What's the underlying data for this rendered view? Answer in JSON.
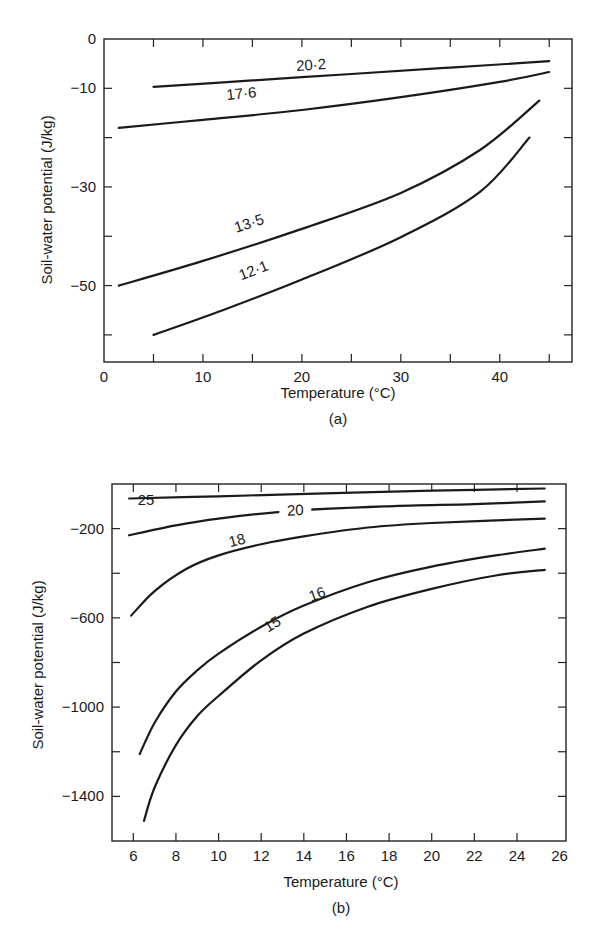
{
  "chart_data": [
    {
      "id": "a",
      "type": "line",
      "panel_label": "(a)",
      "title": "",
      "xlabel": "Temperature (°C)",
      "ylabel": "Soil-water potential (J/kg)",
      "xlim": [
        0,
        47.3
      ],
      "ylim": [
        -65.5,
        0
      ],
      "x_ticks": [
        5,
        10,
        15,
        20,
        25,
        30,
        35,
        40,
        45
      ],
      "x_tick_labels": [
        {
          "v": 0,
          "t": "0"
        },
        {
          "v": 10,
          "t": "10"
        },
        {
          "v": 20,
          "t": "20"
        },
        {
          "v": 30,
          "t": "30"
        },
        {
          "v": 40,
          "t": "40"
        }
      ],
      "y_ticks": [
        -10,
        -20,
        -30,
        -40,
        -50,
        -60
      ],
      "y_tick_labels": [
        {
          "v": 0,
          "t": "0"
        },
        {
          "v": -10,
          "t": "-10"
        },
        {
          "v": -30,
          "t": "-30"
        },
        {
          "v": -50,
          "t": "-50"
        }
      ],
      "grid": false,
      "legend": "inline curve labels (water content, %)",
      "series": [
        {
          "name": "20·2",
          "x": [
            5,
            15,
            25,
            35,
            45
          ],
          "y": [
            -9.7,
            -8.4,
            -7.1,
            -5.8,
            -4.5
          ],
          "label_at": [
            21,
            -7.5
          ]
        },
        {
          "name": "17·6",
          "x": [
            1.5,
            10,
            20,
            30,
            40,
            45
          ],
          "y": [
            -18,
            -16.4,
            -14.4,
            -11.8,
            -8.7,
            -6.7
          ],
          "label_at": [
            14,
            -13.3
          ]
        },
        {
          "name": "13·5",
          "x": [
            1.5,
            10,
            20,
            30,
            38,
            44
          ],
          "y": [
            -50,
            -45,
            -38.5,
            -31.2,
            -22.5,
            -12.5
          ],
          "label_at": [
            15,
            -39.5
          ]
        },
        {
          "name": "12·1",
          "x": [
            5,
            12,
            20,
            30,
            38,
            43
          ],
          "y": [
            -60,
            -55,
            -48.8,
            -40.2,
            -31,
            -20
          ],
          "label_at": [
            15.5,
            -49
          ]
        }
      ]
    },
    {
      "id": "b",
      "type": "line",
      "panel_label": "(b)",
      "title": "",
      "xlabel": "Temperature (°C)",
      "ylabel": "Soil-water potential (J/kg)",
      "xlim": [
        5,
        26.3
      ],
      "ylim": [
        -1600,
        0
      ],
      "x_ticks": [
        6,
        8,
        10,
        12,
        14,
        16,
        18,
        20,
        22,
        24
      ],
      "x_tick_labels": [
        {
          "v": 6,
          "t": "6"
        },
        {
          "v": 8,
          "t": "8"
        },
        {
          "v": 10,
          "t": "10"
        },
        {
          "v": 12,
          "t": "12"
        },
        {
          "v": 14,
          "t": "14"
        },
        {
          "v": 16,
          "t": "16"
        },
        {
          "v": 18,
          "t": "18"
        },
        {
          "v": 20,
          "t": "20"
        },
        {
          "v": 22,
          "t": "22"
        },
        {
          "v": 24,
          "t": "24"
        },
        {
          "v": 26,
          "t": "26"
        }
      ],
      "y_ticks": [
        -200,
        -400,
        -600,
        -800,
        -1000,
        -1200,
        -1400
      ],
      "y_tick_labels": [
        {
          "v": -200,
          "t": "-200"
        },
        {
          "v": -600,
          "t": "-600"
        },
        {
          "v": -1000,
          "t": "-1000"
        },
        {
          "v": -1400,
          "t": "-1400"
        }
      ],
      "grid": false,
      "legend": "inline curve labels (water content, %)",
      "series": [
        {
          "name": "25",
          "x": [
            5.8,
            10,
            15,
            20,
            25.3
          ],
          "y": [
            -65,
            -55,
            -42,
            -30,
            -20
          ],
          "label_at": [
            6.6,
            -120
          ]
        },
        {
          "name": "20",
          "x": [
            5.8,
            8,
            10,
            13.5,
            18,
            22,
            25.3
          ],
          "y": [
            -230,
            -185,
            -155,
            -120,
            -100,
            -90,
            -78
          ],
          "label_at": [
            13.6,
            -118
          ]
        },
        {
          "name": "18",
          "x": [
            5.9,
            7,
            8.5,
            10,
            12,
            14,
            17,
            20,
            25.3
          ],
          "y": [
            -590,
            -480,
            -380,
            -320,
            -270,
            -235,
            -195,
            -175,
            -155
          ],
          "label_at": [
            11.0,
            -300
          ]
        },
        {
          "name": "16",
          "x": [
            6.3,
            7,
            8,
            9,
            10,
            12,
            14,
            17,
            20,
            23,
            25.3
          ],
          "y": [
            -1210,
            -1070,
            -930,
            -835,
            -760,
            -640,
            -545,
            -440,
            -370,
            -320,
            -290
          ],
          "label_at": [
            14.8,
            -540
          ]
        },
        {
          "name": "15",
          "x": [
            6.5,
            7,
            8,
            9,
            10,
            12,
            14,
            17,
            20,
            23,
            25.3
          ],
          "y": [
            -1510,
            -1360,
            -1170,
            -1040,
            -950,
            -790,
            -670,
            -550,
            -470,
            -410,
            -385
          ],
          "label_at": [
            12.8,
            -670
          ]
        }
      ]
    }
  ]
}
